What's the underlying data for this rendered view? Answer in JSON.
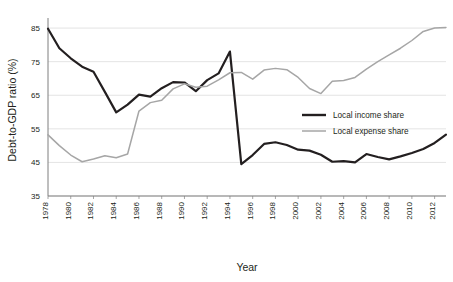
{
  "chart_data": {
    "type": "line",
    "title": "",
    "xlabel": "Year",
    "ylabel": "Debt-to-GDP ratio (%)",
    "xlim": [
      1978,
      2013
    ],
    "ylim": [
      35,
      88
    ],
    "ytick_values": [
      85,
      75,
      65,
      55,
      45,
      35
    ],
    "ytick_labels": [
      "85",
      "75",
      "65",
      "55",
      "45",
      "35"
    ],
    "xtick_values": [
      1978,
      1980,
      1982,
      1984,
      1986,
      1988,
      1990,
      1992,
      1994,
      1996,
      1998,
      2000,
      2002,
      2004,
      2006,
      2008,
      2010,
      2012
    ],
    "xtick_labels": [
      "1978",
      "1980",
      "1982",
      "1984",
      "1986",
      "1988",
      "1990",
      "1992",
      "1994",
      "1996",
      "1998",
      "2000",
      "2002",
      "2004",
      "2006",
      "2008",
      "2010",
      "2012"
    ],
    "grid": "horizontal",
    "legend_position": "center-right",
    "x": [
      1978,
      1979,
      1980,
      1981,
      1982,
      1983,
      1984,
      1985,
      1986,
      1987,
      1988,
      1989,
      1990,
      1991,
      1992,
      1993,
      1994,
      1995,
      1996,
      1997,
      1998,
      1999,
      2000,
      2001,
      2002,
      2003,
      2004,
      2005,
      2006,
      2007,
      2008,
      2009,
      2010,
      2011,
      2012,
      2013
    ],
    "series": [
      {
        "name": "Local income share",
        "color": "#231f20",
        "linewidth": 2.2,
        "values": [
          84.8,
          79.0,
          76.0,
          73.5,
          72.0,
          66.0,
          59.9,
          62.2,
          65.2,
          64.6,
          67.1,
          68.9,
          68.8,
          66.2,
          69.5,
          71.5,
          78.0,
          44.5,
          47.2,
          50.5,
          51.0,
          50.2,
          48.8,
          48.5,
          47.3,
          45.2,
          45.4,
          45.0,
          47.5,
          46.6,
          45.9,
          46.8,
          47.8,
          49.0,
          50.8,
          53.3
        ]
      },
      {
        "name": "Local expense share",
        "color": "#a6a6a6",
        "linewidth": 1.5,
        "values": [
          53.2,
          50.0,
          47.2,
          45.2,
          46.0,
          47.0,
          46.4,
          47.5,
          60.3,
          62.8,
          63.5,
          66.9,
          68.4,
          67.4,
          67.7,
          69.6,
          71.7,
          71.8,
          69.8,
          72.5,
          73.0,
          72.6,
          70.3,
          67.0,
          65.5,
          69.2,
          69.4,
          70.3,
          72.8,
          75.0,
          77.0,
          79.0,
          81.3,
          84.0,
          85.0,
          85.2
        ]
      }
    ]
  },
  "legend": {
    "entries": [
      {
        "label": "Local income share",
        "swatch": "black-thick-line"
      },
      {
        "label": "Local expense share",
        "swatch": "gray-thin-line"
      }
    ]
  },
  "colors": {
    "income_series": "#231f20",
    "expense_series": "#a6a6a6",
    "gridline": "#d9d9d9",
    "axis": "#7f7f7f",
    "background": "#ffffff"
  }
}
